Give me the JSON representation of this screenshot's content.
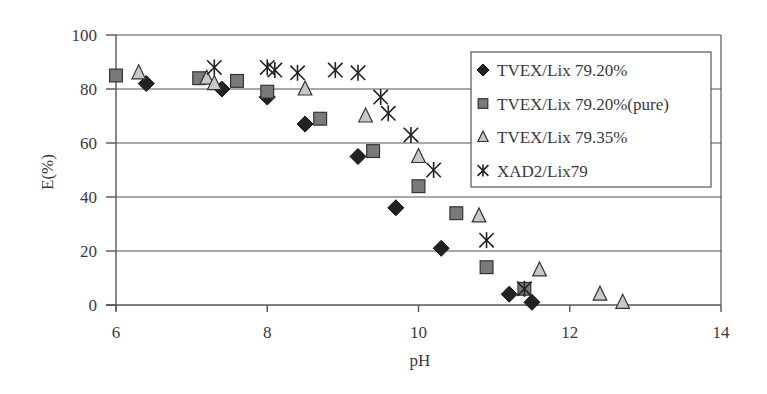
{
  "chart_data": {
    "type": "scatter",
    "title": "",
    "xlabel": "pH",
    "ylabel": "E(%)",
    "xlim": [
      6,
      14
    ],
    "ylim": [
      0,
      100
    ],
    "x_ticks": [
      6,
      8,
      10,
      12,
      14
    ],
    "y_ticks": [
      0,
      20,
      40,
      60,
      80,
      100
    ],
    "grid": "horizontal",
    "legend_position": "upper right (inside plot)",
    "series": [
      {
        "name": "TVEX/Lix 79.20%",
        "marker": "diamond",
        "color": "#222222",
        "points": [
          [
            6.4,
            82
          ],
          [
            7.4,
            80
          ],
          [
            8.0,
            77
          ],
          [
            8.5,
            67
          ],
          [
            9.2,
            55
          ],
          [
            9.7,
            36
          ],
          [
            10.3,
            21
          ],
          [
            11.2,
            4
          ],
          [
            11.5,
            1
          ]
        ]
      },
      {
        "name": "TVEX/Lix 79.20%(pure)",
        "marker": "square",
        "color": "#7a7a7a",
        "points": [
          [
            6.0,
            85
          ],
          [
            7.1,
            84
          ],
          [
            7.6,
            83
          ],
          [
            8.0,
            79
          ],
          [
            8.7,
            69
          ],
          [
            9.4,
            57
          ],
          [
            10.0,
            44
          ],
          [
            10.5,
            34
          ],
          [
            10.9,
            14
          ],
          [
            11.4,
            6
          ]
        ]
      },
      {
        "name": "TVEX/Lix 79.35%",
        "marker": "triangle",
        "color": "#c8c8c8",
        "points": [
          [
            6.3,
            86
          ],
          [
            7.2,
            84
          ],
          [
            7.3,
            82
          ],
          [
            8.5,
            80
          ],
          [
            9.3,
            70
          ],
          [
            10.0,
            55
          ],
          [
            10.8,
            33
          ],
          [
            11.6,
            13
          ],
          [
            12.4,
            4
          ],
          [
            12.7,
            1
          ]
        ]
      },
      {
        "name": "XAD2/Lix79",
        "marker": "asterisk",
        "color": "#222222",
        "points": [
          [
            7.3,
            88
          ],
          [
            8.0,
            88
          ],
          [
            8.1,
            87
          ],
          [
            8.4,
            86
          ],
          [
            8.9,
            87
          ],
          [
            9.2,
            86
          ],
          [
            9.5,
            77
          ],
          [
            9.6,
            71
          ],
          [
            9.9,
            63
          ],
          [
            10.2,
            50
          ],
          [
            10.9,
            24
          ],
          [
            11.4,
            6
          ]
        ]
      }
    ]
  }
}
